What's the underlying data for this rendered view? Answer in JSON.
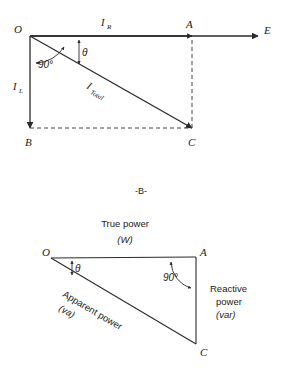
{
  "figure": {
    "caption": "-B-",
    "background_color": "#ffffff",
    "line_color": "#2b2b2b"
  },
  "diagram_top": {
    "name": "current-phasor-diagram",
    "points": {
      "origin": "O",
      "right": "A",
      "bottom_left": "B",
      "bottom_right": "C",
      "axis_end": "E"
    },
    "labels": {
      "horizontal_current": "I",
      "horizontal_current_sub": "R",
      "vertical_current": "I",
      "vertical_current_sub": "L",
      "total_current": "I",
      "total_current_sub": "Total",
      "right_angle": "90°",
      "theta": "θ"
    }
  },
  "diagram_bottom": {
    "name": "power-triangle-diagram",
    "points": {
      "origin": "O",
      "right": "A",
      "bottom_right": "C"
    },
    "labels": {
      "true_power": "True power",
      "true_power_unit": "(W)",
      "true_power_unit_symbol": "W",
      "apparent_power": "Apparent power",
      "apparent_power_unit": "(va)",
      "apparent_power_unit_symbol": "va",
      "reactive_power_line1": "Reactive",
      "reactive_power_line2": "power",
      "reactive_power_unit": "(var)",
      "reactive_power_unit_symbol": "var",
      "right_angle": "90°",
      "theta": "θ"
    }
  }
}
